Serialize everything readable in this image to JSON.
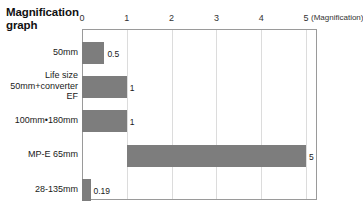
{
  "chart_data": {
    "type": "bar",
    "orientation": "horizontal",
    "title": "Magnification\ngraph",
    "xlabel": "(Magnification)",
    "ylabel": "",
    "xlim": [
      0,
      5.2
    ],
    "grid": true,
    "legend": "none",
    "xticks": [
      0,
      1,
      2,
      3,
      4,
      5
    ],
    "xtick_labels": [
      "0",
      "1",
      "2",
      "3",
      "4",
      "5"
    ],
    "categories": [
      "50mm",
      "Life size\n50mm+converter\nEF",
      "100mm•180mm",
      "MP-E 65mm",
      "28-135mm"
    ],
    "values": [
      0.5,
      1,
      1,
      5,
      0.19
    ],
    "bar_starts": [
      0,
      0,
      0,
      1,
      0
    ],
    "value_labels": [
      "0.5",
      "1",
      "1",
      "5",
      "0.19"
    ],
    "bar_color": "#7d7d7d",
    "grid_color": "#dcdcdc",
    "frame_color": "#9a9a9a",
    "text_color": "#1a1a1a"
  }
}
